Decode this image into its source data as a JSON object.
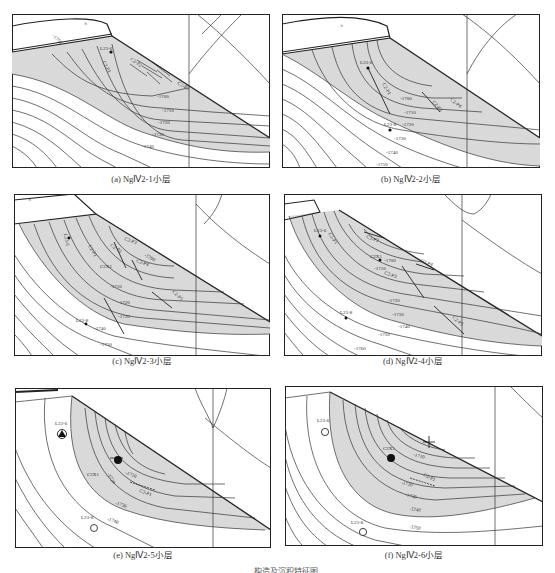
{
  "figure": {
    "caption_partial": "……构造及沉积特征图",
    "colors": {
      "shaded_area": "#d9d9d9",
      "line": "#333333",
      "frame": "#222222",
      "background": "#ffffff"
    },
    "panels": [
      {
        "id": "a",
        "caption": "(a) NgⅣ2-1小层",
        "contour_labels": [
          "-1700",
          "-1710",
          "-1720",
          "-1730",
          "-1740",
          "-1750"
        ],
        "wells": [
          {
            "name": "L23-6",
            "symbol": "dot"
          }
        ],
        "fault_labels": [
          "C2-P1",
          "C2-P2",
          "C2-P3",
          "C2-P4"
        ]
      },
      {
        "id": "b",
        "caption": "(b) NgⅣ2-2小层",
        "contour_labels": [
          "-1700",
          "-1710",
          "-1720",
          "-1730",
          "-1740",
          "-1750"
        ],
        "wells": [
          {
            "name": "L23-6",
            "symbol": "dot"
          },
          {
            "name": "L23-8",
            "symbol": "dot"
          }
        ],
        "fault_labels": [
          "C2-P1",
          "C2-P2",
          "C2-P3",
          "C2-P4"
        ]
      },
      {
        "id": "c",
        "caption": "(c) NgⅣ2-3小层",
        "contour_labels": [
          "-1700",
          "-1710",
          "-1720",
          "-1730",
          "-1740",
          "-1750"
        ],
        "wells": [
          {
            "name": "L23-6",
            "symbol": "dot"
          },
          {
            "name": "L23-8",
            "symbol": "dot"
          },
          {
            "name": "C2X1",
            "symbol": "dot"
          }
        ],
        "fault_labels": [
          "C2-P1",
          "C2-P2",
          "C2-P3",
          "C2-P4",
          "C2-P5"
        ]
      },
      {
        "id": "d",
        "caption": "(d) NgⅣ2-4小层",
        "contour_labels": [
          "-1700",
          "-1710",
          "-1720",
          "-1730",
          "-1740",
          "-1750",
          "-1760"
        ],
        "wells": [
          {
            "name": "L23-6",
            "symbol": "dot"
          },
          {
            "name": "C2X1",
            "symbol": "dot"
          },
          {
            "name": "L23-8",
            "symbol": "dot"
          }
        ],
        "fault_labels": [
          "C2-P1",
          "C2-P2",
          "C2-P3",
          "C2-P4",
          "C2-P5"
        ]
      },
      {
        "id": "e",
        "caption": "(e) NgⅣ2-5小层",
        "contour_labels": [
          "-1710",
          "-1720",
          "-1730",
          "-1740"
        ],
        "wells": [
          {
            "name": "L23-6",
            "symbol": "triangle-circle"
          },
          {
            "name": "C2X1",
            "symbol": "large-dot"
          },
          {
            "name": "L23-8",
            "symbol": "open-circle"
          }
        ],
        "fault_labels": [
          "C2-P1"
        ]
      },
      {
        "id": "f",
        "caption": "(f) NgⅣ2-6小层",
        "contour_labels": [
          "-1710",
          "-1720",
          "-1730",
          "-1740",
          "-1750"
        ],
        "wells": [
          {
            "name": "L23-6",
            "symbol": "open-circle"
          },
          {
            "name": "C2X1",
            "symbol": "large-dot"
          },
          {
            "name": "L23-8",
            "symbol": "open-circle"
          }
        ],
        "fault_labels": [
          "C2-P1"
        ]
      }
    ]
  }
}
